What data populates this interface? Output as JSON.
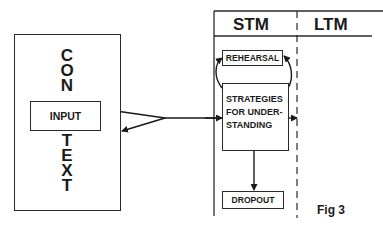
{
  "figure": {
    "caption": "Fig 3"
  },
  "context": {
    "letters_top": [
      "C",
      "O",
      "N"
    ],
    "letters_bottom": [
      "T",
      "E",
      "X",
      "T"
    ],
    "input_label": "INPUT"
  },
  "memory": {
    "stm_label": "STM",
    "ltm_label": "LTM",
    "rehearsal_label": "REHEARSAL",
    "strategies_lines": [
      "STRATEGIES",
      "FOR UNDER-",
      "STANDING"
    ],
    "dropout_label": "DROPOUT"
  },
  "colors": {
    "ink": "#1a1a1a",
    "background": "#ffffff"
  }
}
